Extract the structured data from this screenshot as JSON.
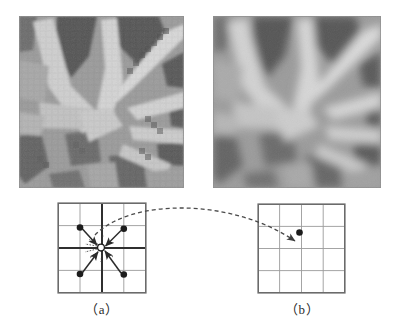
{
  "figure": {
    "type": "interpolation-illustration",
    "background_color": "#ffffff",
    "panels": [
      {
        "id": "a",
        "caption": "（a）",
        "image": {
          "name": "pixelated-leaf-image",
          "description": "coarse pixelated grayscale photograph of palm-like leaf fronds",
          "rendering": "blocky / nearest-neighbour, visible square pixels",
          "grayscale_range": [
            "#3f3f3f",
            "#e2e2e2"
          ],
          "border_color": "#8c8c8c"
        },
        "grid": {
          "name": "source-sample-grid",
          "columns": 4,
          "rows": 4,
          "thin_line_color": "#9a9a9a",
          "thick_line_color": "#333333",
          "border_color": "#6b6b6b",
          "thick_lines": [
            "vertical-center",
            "horizontal-center"
          ]
        },
        "points": [
          {
            "name": "neighbour-top-left",
            "x": 0.26,
            "y": 0.28,
            "filled": true
          },
          {
            "name": "neighbour-top-right",
            "x": 0.74,
            "y": 0.28,
            "filled": true
          },
          {
            "name": "neighbour-bottom-left",
            "x": 0.26,
            "y": 0.76,
            "filled": true
          },
          {
            "name": "neighbour-bottom-right",
            "x": 0.74,
            "y": 0.76,
            "filled": true
          },
          {
            "name": "interpolated-point",
            "x": 0.46,
            "y": 0.46,
            "filled": false
          }
        ],
        "arrows": [
          {
            "from": "neighbour-top-left",
            "to": "interpolated-point"
          },
          {
            "from": "neighbour-top-right",
            "to": "interpolated-point"
          },
          {
            "from": "neighbour-bottom-left",
            "to": "interpolated-point"
          },
          {
            "from": "neighbour-bottom-right",
            "to": "interpolated-point"
          }
        ],
        "weight_marks": {
          "name": "weight-tick-marks",
          "description": "short dashed tick strokes radiating from the hollow interpolated point"
        }
      },
      {
        "id": "b",
        "caption": "（b）",
        "image": {
          "name": "smoothed-leaf-image",
          "description": "smooth interpolated grayscale photograph of the same leaf fronds",
          "rendering": "blurred / bilinearly interpolated, no visible pixel blocks",
          "grayscale_range": [
            "#3f3f3f",
            "#e6e6e6"
          ],
          "border_color": "#8c8c8c"
        },
        "grid": {
          "name": "target-sample-grid",
          "columns": 4,
          "rows": 4,
          "thin_line_color": "#9a9a9a",
          "thick_line_color": "#9a9a9a",
          "border_color": "#6b6b6b",
          "thick_lines": []
        },
        "points": [
          {
            "name": "mapped-output-point",
            "x": 0.48,
            "y": 0.32,
            "filled": true
          }
        ],
        "arrows": [
          {
            "from": "mapping-arc",
            "to": "mapped-output-point"
          }
        ]
      }
    ],
    "connector": {
      "name": "mapping-arc",
      "style": "dashed-curved-arrow",
      "color": "#4a4a4a",
      "dash": "4 3",
      "from_panel": "a",
      "to_panel": "b",
      "description": "dashed arc running from the interpolated point in panel (a) to the mapped point in panel (b)"
    }
  }
}
